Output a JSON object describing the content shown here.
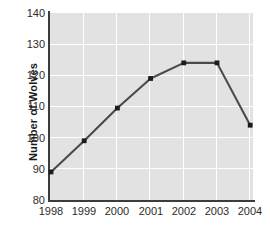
{
  "chart_data": {
    "type": "line",
    "title": "",
    "xlabel": "",
    "ylabel": "Number of Wolves",
    "categories": [
      "1998",
      "1999",
      "2000",
      "2001",
      "2002",
      "2003",
      "2004"
    ],
    "values": [
      89,
      99,
      109.5,
      119,
      124,
      124,
      104
    ],
    "series": [
      {
        "name": "Number of Wolves",
        "values": [
          89,
          99,
          109.5,
          119,
          124,
          124,
          104
        ]
      }
    ],
    "ylim": [
      80,
      140
    ],
    "yticks": [
      80,
      90,
      100,
      110,
      120,
      130,
      140
    ],
    "ytick_labels": [
      "80",
      "90",
      "100",
      "110",
      "120",
      "130",
      "140"
    ],
    "xtick_labels": [
      "1998",
      "1999",
      "2000",
      "2001",
      "2002",
      "2003",
      "2004"
    ],
    "grid": true,
    "grid_color": "#ffffff",
    "plot_background": "#e2e2e2",
    "line_color": "#4a4a4a",
    "marker_color": "#1c1c1c",
    "axis_color": "#3c3c3c",
    "legend": false,
    "legend_position": "none"
  }
}
